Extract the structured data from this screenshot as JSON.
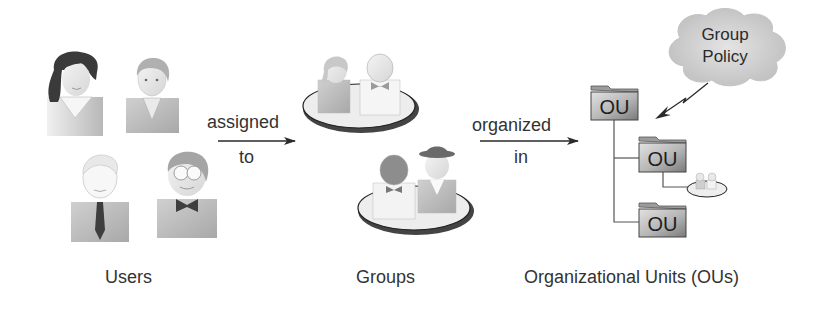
{
  "diagram": {
    "sections": [
      {
        "id": "users",
        "caption": "Users"
      },
      {
        "id": "groups",
        "caption": "Groups"
      },
      {
        "id": "ous",
        "caption": "Organizational Units (OUs)"
      }
    ],
    "arrows": [
      {
        "id": "assigned-to",
        "label_top": "assigned",
        "label_bottom": "to"
      },
      {
        "id": "organized-in",
        "label_top": "organized",
        "label_bottom": "in"
      }
    ],
    "users": [
      {
        "name": "woman-long-hair-icon"
      },
      {
        "name": "man-short-hair-icon"
      },
      {
        "name": "man-with-tie-icon"
      },
      {
        "name": "man-with-bowtie-glasses-icon"
      }
    ],
    "groups": [
      {
        "name": "group-1-icon",
        "members": 2
      },
      {
        "name": "group-2-icon",
        "members": 2
      }
    ],
    "ou_tree": {
      "nodes": [
        {
          "label": "OU",
          "level": 0
        },
        {
          "label": "OU",
          "level": 1
        },
        {
          "label": "OU",
          "level": 1
        }
      ],
      "attached_group": "small-group-icon"
    },
    "policy": {
      "line1": "Group",
      "line2": "Policy"
    },
    "colors": {
      "text": "#333333",
      "arrow": "#2a2a2a",
      "folder_light": "#d8d8d8",
      "folder_dark": "#8a8a8a",
      "cloud": "#cfcfcf",
      "ellipse_fill": "#eeeeee",
      "ellipse_stroke": "#222222"
    }
  }
}
